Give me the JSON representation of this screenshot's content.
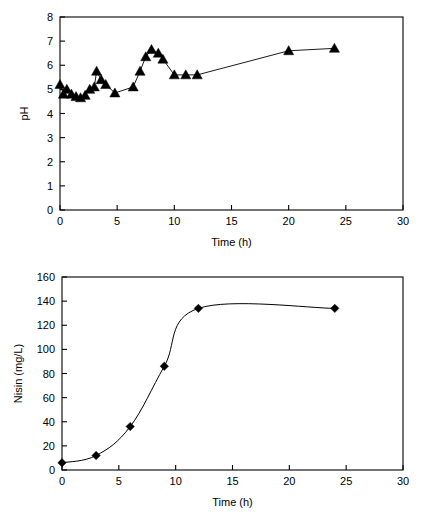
{
  "figure": {
    "background": "#ffffff",
    "line_color": "#000000",
    "marker_color": "#000000",
    "axis_color": "#000000"
  },
  "chart_data": [
    {
      "id": "ph-chart",
      "type": "line",
      "title": "",
      "xlabel": "Time (h)",
      "ylabel": "pH",
      "xlim": [
        0,
        30
      ],
      "ylim": [
        0,
        8
      ],
      "xticks": [
        0,
        5,
        10,
        15,
        20,
        25,
        30
      ],
      "yticks": [
        0,
        1,
        2,
        3,
        4,
        5,
        6,
        7,
        8
      ],
      "xtick_labels": [
        "0",
        "5",
        "10",
        "15",
        "20",
        "25",
        "30"
      ],
      "ytick_labels": [
        "0",
        "1",
        "2",
        "3",
        "4",
        "5",
        "6",
        "7",
        "8"
      ],
      "grid": false,
      "legend": false,
      "marker": "triangle",
      "series": [
        {
          "name": "pH",
          "x": [
            0.0,
            0.3,
            0.6,
            1.0,
            1.4,
            1.8,
            2.2,
            2.6,
            3.0,
            3.2,
            3.6,
            4.0,
            4.8,
            6.4,
            7.0,
            7.5,
            8.0,
            8.6,
            9.0,
            10.0,
            11.0,
            12.0,
            20.0,
            24.0
          ],
          "y": [
            5.2,
            4.8,
            5.0,
            4.8,
            4.7,
            4.65,
            4.75,
            5.0,
            5.1,
            5.75,
            5.4,
            5.2,
            4.85,
            5.1,
            5.75,
            6.35,
            6.65,
            6.5,
            6.25,
            5.6,
            5.6,
            5.6,
            6.6,
            6.7
          ]
        }
      ]
    },
    {
      "id": "nisin-chart",
      "type": "line",
      "title": "",
      "xlabel": "Time (h)",
      "ylabel": "Nisin (mg/L)",
      "xlim": [
        0,
        30
      ],
      "ylim": [
        0,
        160
      ],
      "xticks": [
        0,
        5,
        10,
        15,
        20,
        25,
        30
      ],
      "yticks": [
        0,
        20,
        40,
        60,
        80,
        100,
        120,
        140,
        160
      ],
      "xtick_labels": [
        "0",
        "5",
        "10",
        "15",
        "20",
        "25",
        "30"
      ],
      "ytick_labels": [
        "0",
        "20",
        "40",
        "60",
        "80",
        "100",
        "120",
        "140",
        "160"
      ],
      "grid": false,
      "legend": false,
      "marker": "diamond",
      "series": [
        {
          "name": "Nisin",
          "x": [
            0,
            3,
            6,
            9,
            12,
            24
          ],
          "y": [
            6,
            12,
            36,
            86,
            134,
            134
          ]
        }
      ]
    }
  ]
}
